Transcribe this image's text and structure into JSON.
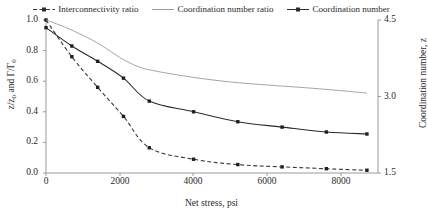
{
  "legend": {
    "position": "top-center",
    "entries": [
      {
        "label": "Interconnectivity ratio",
        "style": "dashed-with-markers",
        "color": "#3a3a3a"
      },
      {
        "label": "Coordination number ratio",
        "style": "solid-light",
        "color": "#9a9a9a"
      },
      {
        "label": "Coordination number",
        "style": "solid-with-markers",
        "color": "#2b2b2b"
      }
    ]
  },
  "axes": {
    "x": {
      "title": "Net stress, psi",
      "ticks": [
        "0",
        "2000",
        "4000",
        "6000",
        "8000"
      ],
      "tick_values": [
        0,
        2000,
        4000,
        6000,
        8000
      ],
      "min": 0,
      "max": 9000
    },
    "y_left": {
      "title_parts": {
        "pre": "z/z",
        "sub1": "0",
        "mid": " and Γ/Γ",
        "sub2": "0"
      },
      "title": "z/z0 and Γ/Γ0",
      "ticks": [
        "0.0",
        "0.2",
        "0.4",
        "0.6",
        "0.8",
        "1.0"
      ],
      "tick_values": [
        0.0,
        0.2,
        0.4,
        0.6,
        0.8,
        1.0
      ],
      "min": 0.0,
      "max": 1.0
    },
    "y_right": {
      "title": "Coordination number, z",
      "ticks": [
        "1.5",
        "3.0",
        "4.5"
      ],
      "tick_values": [
        1.5,
        3.0,
        4.5
      ],
      "min": 1.5,
      "max": 4.5
    }
  },
  "chart_data": {
    "type": "line",
    "title": "",
    "xlabel": "Net stress, psi",
    "ylabel": "z/z0 and Γ/Γ0",
    "ylabel_secondary": "Coordination number, z",
    "xlim": [
      0,
      9000
    ],
    "ylim": [
      0,
      1.0
    ],
    "ylim_secondary": [
      1.5,
      4.5
    ],
    "grid": false,
    "legend_position": "top",
    "series": [
      {
        "name": "Interconnectivity ratio",
        "axis": "left",
        "color": "#3a3a3a",
        "line_style": "dashed",
        "markers": true,
        "x": [
          0,
          700,
          1400,
          2100,
          2800,
          4000,
          5200,
          6400,
          7600,
          8700
        ],
        "y": [
          1.0,
          0.76,
          0.56,
          0.37,
          0.165,
          0.09,
          0.055,
          0.04,
          0.028,
          0.018
        ]
      },
      {
        "name": "Coordination number ratio",
        "axis": "left",
        "color": "#9a9a9a",
        "line_style": "solid",
        "markers": false,
        "x": [
          0,
          500,
          1000,
          1500,
          2000,
          2500,
          3000,
          4000,
          5000,
          6000,
          7000,
          8000,
          8700
        ],
        "y": [
          1.0,
          0.955,
          0.9,
          0.835,
          0.755,
          0.695,
          0.665,
          0.625,
          0.595,
          0.575,
          0.558,
          0.538,
          0.522
        ]
      },
      {
        "name": "Coordination number",
        "axis": "right",
        "color": "#2b2b2b",
        "line_style": "solid",
        "markers": true,
        "x": [
          0,
          700,
          1400,
          2100,
          2800,
          4000,
          5200,
          6400,
          7600,
          8700
        ],
        "y": [
          0.95,
          0.83,
          0.73,
          0.62,
          0.47,
          0.4,
          0.335,
          0.3,
          0.268,
          0.255
        ],
        "y_secondary": [
          4.35,
          3.99,
          3.69,
          3.36,
          2.91,
          2.7,
          2.505,
          2.4,
          2.304,
          2.265
        ]
      }
    ]
  },
  "colors": {
    "axis": "#8a8a8a",
    "text": "#2b2b2b",
    "series_light": "#9a9a9a",
    "series_dark": "#2b2b2b"
  }
}
